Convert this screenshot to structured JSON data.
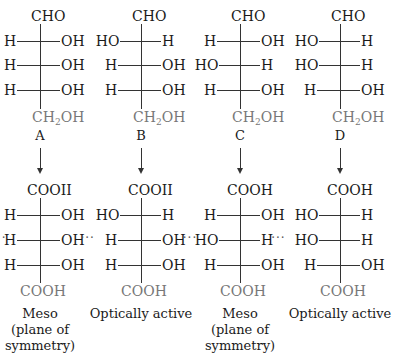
{
  "diagram": {
    "type": "fischer-projection-oxidation",
    "columns": [
      {
        "label": "A",
        "reactant": {
          "top": "CHO",
          "rows": [
            [
              "H",
              "OH"
            ],
            [
              "H",
              "OH"
            ],
            [
              "H",
              "OH"
            ]
          ],
          "bottom_main": "CH",
          "bottom_sub": "2",
          "bottom_tail": "OH"
        },
        "product": {
          "top": "COOII",
          "rows": [
            [
              "H",
              "OH"
            ],
            [
              "H",
              "OH"
            ],
            [
              "H",
              "OH"
            ]
          ],
          "bottom": "COOH",
          "symmetry_row": 1
        },
        "caption": [
          "Meso",
          "(plane of",
          "symmetry)"
        ]
      },
      {
        "label": "B",
        "reactant": {
          "top": "CHO",
          "rows": [
            [
              "HO",
              "H"
            ],
            [
              "H",
              "OH"
            ],
            [
              "H",
              "OH"
            ]
          ],
          "bottom_main": "CH",
          "bottom_sub": "2",
          "bottom_tail": "OH"
        },
        "product": {
          "top": "COOII",
          "rows": [
            [
              "HO",
              "H"
            ],
            [
              "H",
              "OH"
            ],
            [
              "H",
              "OH"
            ]
          ],
          "bottom": "COOH",
          "symmetry_row": null
        },
        "caption": [
          "Optically active"
        ]
      },
      {
        "label": "C",
        "reactant": {
          "top": "CHO",
          "rows": [
            [
              "H",
              "OH"
            ],
            [
              "HO",
              "H"
            ],
            [
              "H",
              "OH"
            ]
          ],
          "bottom_main": "CH",
          "bottom_sub": "2",
          "bottom_tail": "OH"
        },
        "product": {
          "top": "COOH",
          "rows": [
            [
              "H",
              "OH"
            ],
            [
              "HO",
              "H"
            ],
            [
              "H",
              "OH"
            ]
          ],
          "bottom": "COOH",
          "symmetry_row": 1
        },
        "caption": [
          "Meso",
          "(plane of",
          "symmetry)"
        ]
      },
      {
        "label": "D",
        "reactant": {
          "top": "CHO",
          "rows": [
            [
              "HO",
              "H"
            ],
            [
              "HO",
              "H"
            ],
            [
              "H",
              "OH"
            ]
          ],
          "bottom_main": "CH",
          "bottom_sub": "2",
          "bottom_tail": "OH"
        },
        "product": {
          "top": "COOH",
          "rows": [
            [
              "HO",
              "H"
            ],
            [
              "HO",
              "H"
            ],
            [
              "H",
              "OH"
            ]
          ],
          "bottom": "COOH",
          "symmetry_row": null
        },
        "caption": [
          "Optically active"
        ]
      }
    ],
    "symmetry_marker": "···"
  }
}
